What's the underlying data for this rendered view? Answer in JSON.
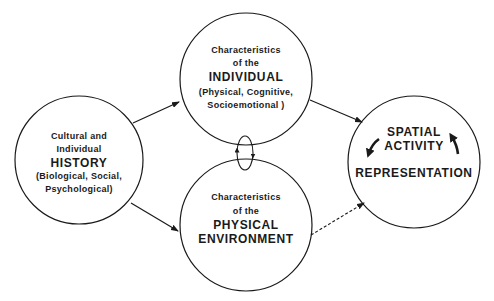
{
  "diagram": {
    "nodes": {
      "history": {
        "line1": "Cultural and",
        "line2": "Individual",
        "title": "HISTORY",
        "sub1": "(Biological, Social,",
        "sub2": "Psychological)"
      },
      "individual": {
        "line1": "Characteristics",
        "line2": "of the",
        "title": "INDIVIDUAL",
        "sub1": "(Physical, Cognitive,",
        "sub2": "Socioemotional )"
      },
      "environment": {
        "line1": "Characteristics",
        "line2": "of the",
        "title1": "PHYSICAL",
        "title2": "ENVIRONMENT"
      },
      "spatial": {
        "title1": "SPATIAL",
        "title2": "ACTIVITY",
        "title3": "REPRESENTATION"
      }
    },
    "edges": [
      {
        "from": "history",
        "to": "individual",
        "style": "solid"
      },
      {
        "from": "history",
        "to": "environment",
        "style": "solid"
      },
      {
        "from": "individual",
        "to": "spatial",
        "style": "solid"
      },
      {
        "from": "environment",
        "to": "spatial",
        "style": "dashed"
      },
      {
        "from": "individual",
        "to": "environment",
        "style": "bidirectional-loop"
      }
    ],
    "colors": {
      "stroke": "#1a1a1a",
      "background": "#ffffff"
    }
  }
}
